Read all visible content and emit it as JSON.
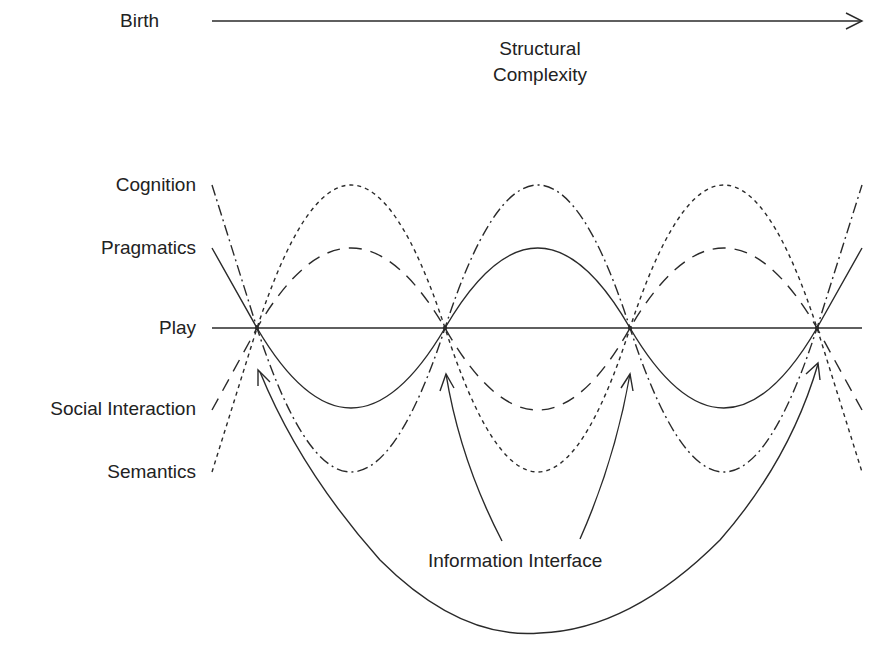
{
  "axis": {
    "start_label": "Birth",
    "title_line1": "Structural",
    "title_line2": "Complexity"
  },
  "series_labels": {
    "cognition": "Cognition",
    "pragmatics": "Pragmatics",
    "play": "Play",
    "social_interaction": "Social Interaction",
    "semantics": "Semantics"
  },
  "bottom_label": "Information Interface",
  "legend": [
    {
      "name": "Cognition",
      "line_style": "dash-dot"
    },
    {
      "name": "Pragmatics",
      "line_style": "solid"
    },
    {
      "name": "Play",
      "line_style": "solid-horizontal"
    },
    {
      "name": "Social Interaction",
      "line_style": "long-dash"
    },
    {
      "name": "Semantics",
      "line_style": "short-dash"
    }
  ],
  "intersection_nodes": 4,
  "colors": {
    "ink": "#2a2a2a",
    "background": "#ffffff"
  }
}
